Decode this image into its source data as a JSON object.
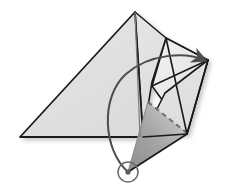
{
  "figure": {
    "background_color": "#ffffff",
    "width": 228,
    "height": 192
  },
  "palette": {
    "paper_front": "#e2e2e2",
    "paper_front_light": "#ededed",
    "paper_back_dark": "#9a9a9a",
    "paper_back_light": "#c9c9c9",
    "outline": "#1a1a1a",
    "fold_dashed": "#6e6e6e",
    "arrow": "#4d4d4d",
    "shadow": "#bdbdbd",
    "pivot_ring": "#6a6a6a"
  },
  "shapes": {
    "main_triangle": {
      "name": "large-left-triangle",
      "points": "20,137 135,12 143,137",
      "fill": "paper_front"
    },
    "upper_right_panel": {
      "name": "upper-right-panel",
      "points": "135,12 166,38 150,80 143,137",
      "fill": "paper_front"
    },
    "right_flap": {
      "name": "right-flap-panel",
      "points": "166,38 208,60 187,134 152,86",
      "fill": "paper_front_light"
    },
    "lower_right_panel": {
      "name": "lower-right-panel",
      "points": "143,137 187,134 208,60 165,93",
      "fill": "paper_front"
    },
    "dark_flap": {
      "name": "dark-underside-flap",
      "points": "148,102 187,133 128,172",
      "fill_gradient": [
        "paper_back_dark",
        "paper_back_light"
      ]
    }
  },
  "lines": {
    "center_crease": {
      "name": "center-vertical-crease",
      "from": "135,12",
      "to": "140,137"
    },
    "dashed_fold": {
      "name": "dashed-fold-line",
      "from": "148,102",
      "to": "187,133",
      "dash": "5,4"
    },
    "flap_edge_left": {
      "name": "flap-left-edge",
      "from": "128,172",
      "to": "187,134"
    },
    "flap_edge_bottom": {
      "name": "flap-bottom-edge",
      "from": "128,172",
      "to": "148,102"
    }
  },
  "arrow": {
    "name": "rotation-arrow",
    "path": "M128,172 C104,150 101,98 126,74 C150,52 185,52 205,61",
    "head_tip": "210,58",
    "direction": "up-right",
    "color": "#4d4d4d"
  },
  "pivot": {
    "name": "pivot-point-marker",
    "cx": 128,
    "cy": 172,
    "outer_radius": 10,
    "inner_radius": 3,
    "color": "#6a6a6a"
  }
}
